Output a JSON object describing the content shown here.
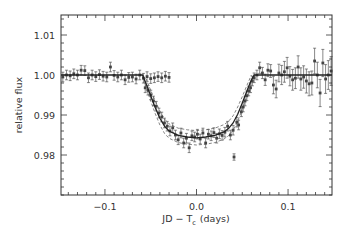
{
  "chart_data": {
    "type": "scatter",
    "title": "",
    "xlabel": "JD − T_c (days)",
    "xlabel_main": "JD − T",
    "xlabel_sub": "c",
    "xlabel_tail": "(days)",
    "ylabel": "relative flux",
    "xlim": [
      -0.148,
      0.148
    ],
    "ylim": [
      0.97,
      1.015
    ],
    "x_ticks": [
      -0.1,
      0.0,
      0.1
    ],
    "x_tick_labels": [
      "−0.1",
      "0.0",
      "0.1"
    ],
    "x_minor_step": 0.01,
    "y_ticks": [
      0.98,
      0.99,
      1.0,
      1.01
    ],
    "y_tick_labels": [
      "0.98",
      "0.99",
      "1.00",
      "1.01"
    ],
    "y_minor_step": 0.002,
    "grid": false,
    "legend": null,
    "series": [
      {
        "name": "observed flux",
        "style": "points-with-errorbars",
        "points": [
          [
            -0.146,
            0.9995,
            0.0012
          ],
          [
            -0.142,
            1.0,
            0.0012
          ],
          [
            -0.138,
            0.9998,
            0.0012
          ],
          [
            -0.134,
            1.0003,
            0.0012
          ],
          [
            -0.13,
            1.0,
            0.0012
          ],
          [
            -0.126,
            1.0012,
            0.0012
          ],
          [
            -0.122,
            1.0011,
            0.0012
          ],
          [
            -0.118,
            0.9993,
            0.0012
          ],
          [
            -0.114,
            1.0,
            0.0012
          ],
          [
            -0.11,
            0.9996,
            0.0012
          ],
          [
            -0.106,
            1.0001,
            0.0012
          ],
          [
            -0.102,
            0.9997,
            0.0012
          ],
          [
            -0.098,
            0.9995,
            0.0012
          ],
          [
            -0.094,
            1.002,
            0.0012
          ],
          [
            -0.09,
            0.9999,
            0.0012
          ],
          [
            -0.086,
            0.9995,
            0.0012
          ],
          [
            -0.082,
            1.0,
            0.0012
          ],
          [
            -0.078,
            0.9988,
            0.0012
          ],
          [
            -0.074,
            0.9994,
            0.0012
          ],
          [
            -0.07,
            0.9995,
            0.0012
          ],
          [
            -0.066,
            0.999,
            0.0012
          ],
          [
            -0.062,
            1.0,
            0.0012
          ],
          [
            -0.058,
            0.9992,
            0.0012
          ],
          [
            -0.054,
            0.9996,
            0.0012
          ],
          [
            -0.05,
            0.9991,
            0.0012
          ],
          [
            -0.046,
            0.9993,
            0.0012
          ],
          [
            -0.042,
            0.9996,
            0.0012
          ],
          [
            -0.038,
            0.9993,
            0.0012
          ],
          [
            -0.034,
            0.9997,
            0.0012
          ],
          [
            -0.03,
            0.9994,
            0.0012
          ],
          [
            -0.056,
            0.9968,
            0.0012
          ],
          [
            -0.053,
            0.9962,
            0.0012
          ],
          [
            -0.05,
            0.995,
            0.0012
          ],
          [
            -0.047,
            0.9935,
            0.0012
          ],
          [
            -0.044,
            0.9922,
            0.0012
          ],
          [
            -0.041,
            0.9905,
            0.0012
          ],
          [
            -0.038,
            0.9895,
            0.0012
          ],
          [
            -0.035,
            0.988,
            0.0012
          ],
          [
            -0.032,
            0.9872,
            0.0012
          ],
          [
            -0.029,
            0.986,
            0.0012
          ],
          [
            -0.026,
            0.9868,
            0.0012
          ],
          [
            -0.023,
            0.985,
            0.0012
          ],
          [
            -0.02,
            0.9838,
            0.0012
          ],
          [
            -0.017,
            0.9855,
            0.0012
          ],
          [
            -0.014,
            0.983,
            0.0012
          ],
          [
            -0.011,
            0.9842,
            0.0012
          ],
          [
            -0.008,
            0.9818,
            0.0012
          ],
          [
            -0.005,
            0.9848,
            0.0012
          ],
          [
            -0.002,
            0.9845,
            0.0012
          ],
          [
            0.001,
            0.9852,
            0.0012
          ],
          [
            0.004,
            0.984,
            0.0012
          ],
          [
            0.007,
            0.9855,
            0.0012
          ],
          [
            0.01,
            0.983,
            0.0012
          ],
          [
            0.013,
            0.9852,
            0.0012
          ],
          [
            0.016,
            0.9848,
            0.0012
          ],
          [
            0.019,
            0.9856,
            0.0012
          ],
          [
            0.022,
            0.9842,
            0.0012
          ],
          [
            0.025,
            0.9853,
            0.0012
          ],
          [
            0.028,
            0.9849,
            0.0012
          ],
          [
            0.031,
            0.9857,
            0.0012
          ],
          [
            0.034,
            0.9872,
            0.0012
          ],
          [
            0.037,
            0.985,
            0.0012
          ],
          [
            0.04,
            0.9862,
            0.0012
          ],
          [
            0.041,
            0.9795,
            0.0008
          ],
          [
            0.044,
            0.9882,
            0.0012
          ],
          [
            0.046,
            0.9875,
            0.0012
          ],
          [
            0.049,
            0.9908,
            0.0012
          ],
          [
            0.051,
            0.992,
            0.0012
          ],
          [
            0.053,
            0.9935,
            0.0012
          ],
          [
            0.055,
            0.9948,
            0.0012
          ],
          [
            0.057,
            0.996,
            0.0012
          ],
          [
            0.059,
            0.9968,
            0.0012
          ],
          [
            0.061,
            0.9985,
            0.0012
          ],
          [
            0.063,
            0.9993,
            0.0012
          ],
          [
            0.066,
            1.0,
            0.0012
          ],
          [
            0.069,
            1.0018,
            0.0014
          ],
          [
            0.072,
            1.0005,
            0.0014
          ],
          [
            0.075,
            0.9988,
            0.0014
          ],
          [
            0.078,
            1.0012,
            0.0016
          ],
          [
            0.081,
            1.001,
            0.0016
          ],
          [
            0.084,
            0.9975,
            0.0022
          ],
          [
            0.087,
            0.9965,
            0.0022
          ],
          [
            0.09,
            1.0005,
            0.0022
          ],
          [
            0.093,
            1.0,
            0.0024
          ],
          [
            0.096,
            1.0008,
            0.0026
          ],
          [
            0.099,
            1.0018,
            0.0026
          ],
          [
            0.102,
            0.9997,
            0.0024
          ],
          [
            0.105,
            0.9988,
            0.0026
          ],
          [
            0.108,
            0.9992,
            0.0026
          ],
          [
            0.111,
            1.002,
            0.0028
          ],
          [
            0.114,
            0.999,
            0.0028
          ],
          [
            0.117,
            0.9995,
            0.0028
          ],
          [
            0.12,
            0.9985,
            0.003
          ],
          [
            0.123,
            0.9978,
            0.003
          ],
          [
            0.126,
            0.998,
            0.003
          ],
          [
            0.129,
            1.0035,
            0.0032
          ],
          [
            0.132,
            1.0,
            0.0032
          ],
          [
            0.135,
            0.9955,
            0.0034
          ],
          [
            0.138,
            1.003,
            0.0034
          ],
          [
            0.141,
            0.999,
            0.0036
          ],
          [
            0.144,
            1.0,
            0.0036
          ],
          [
            0.147,
            1.001,
            0.0036
          ]
        ]
      },
      {
        "name": "best-fit transit model",
        "style": "solid-line",
        "x": [
          -0.148,
          -0.059,
          -0.055,
          -0.05,
          -0.045,
          -0.04,
          -0.035,
          -0.03,
          -0.02,
          -0.01,
          0.0,
          0.01,
          0.02,
          0.03,
          0.035,
          0.04,
          0.045,
          0.05,
          0.055,
          0.06,
          0.063,
          0.148
        ],
        "y": [
          1.0,
          1.0,
          0.9978,
          0.9948,
          0.9918,
          0.9892,
          0.9872,
          0.986,
          0.9849,
          0.9845,
          0.9843,
          0.9845,
          0.9849,
          0.9858,
          0.9866,
          0.988,
          0.9902,
          0.993,
          0.996,
          0.9988,
          1.0,
          1.0
        ]
      },
      {
        "name": "upper envelope",
        "style": "dashed-line",
        "x": [
          -0.06,
          -0.055,
          -0.05,
          -0.045,
          -0.04,
          -0.035,
          -0.03,
          -0.02,
          -0.01,
          0.0,
          0.01,
          0.02,
          0.03,
          0.035,
          0.04,
          0.045,
          0.05,
          0.055,
          0.06
        ],
        "y": [
          1.0,
          0.999,
          0.9962,
          0.9935,
          0.991,
          0.989,
          0.9878,
          0.9867,
          0.9863,
          0.9861,
          0.9863,
          0.9867,
          0.9876,
          0.9884,
          0.9898,
          0.992,
          0.9946,
          0.9974,
          1.0
        ]
      },
      {
        "name": "lower envelope",
        "style": "dashed-line",
        "x": [
          -0.058,
          -0.055,
          -0.05,
          -0.045,
          -0.04,
          -0.035,
          -0.03,
          -0.02,
          -0.01,
          0.0,
          0.01,
          0.02,
          0.03,
          0.035,
          0.04,
          0.045,
          0.05,
          0.055,
          0.06,
          0.064
        ],
        "y": [
          1.0,
          0.9968,
          0.9935,
          0.9903,
          0.9875,
          0.9854,
          0.9842,
          0.9831,
          0.9827,
          0.9825,
          0.9827,
          0.9831,
          0.984,
          0.9848,
          0.9862,
          0.9885,
          0.9914,
          0.9946,
          0.9976,
          1.0
        ]
      }
    ]
  }
}
